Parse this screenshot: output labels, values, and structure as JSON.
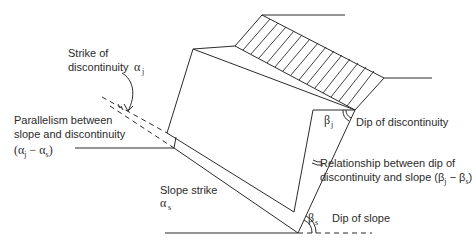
{
  "figure": {
    "labels": {
      "strike_of_discontinuity_line1": "Strike of",
      "strike_of_discontinuity_line2": "discontinuity",
      "parallelism_line1": "Parallelism between",
      "parallelism_line2": "slope and discontinuity",
      "parallelism_formula_open": "(α",
      "parallelism_formula_sub_j": "j",
      "parallelism_formula_minus": " − α",
      "parallelism_formula_sub_s": "s",
      "parallelism_formula_close": ")",
      "dip_of_discontinuity": "Dip of discontinuity",
      "relationship_line1": "Relationship between dip of",
      "relationship_line2": "discontinuity and slope (β",
      "relationship_sub_j": "j",
      "relationship_minus": " − β",
      "relationship_sub_s": "s",
      "relationship_close": ")",
      "slope_strike": "Slope strike",
      "dip_of_slope": "Dip of slope"
    },
    "symbols": {
      "alpha": "α",
      "beta": "β",
      "sub_j": "j",
      "sub_s": "s"
    },
    "colors": {
      "stroke": "#2b2b2b",
      "background": "#ffffff"
    }
  }
}
